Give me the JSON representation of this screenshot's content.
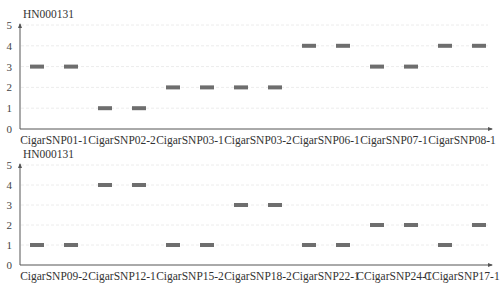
{
  "chart_data": [
    {
      "type": "scatter",
      "marker": "horizontal-bar",
      "title": "HN000131",
      "xlabel": "",
      "ylabel": "",
      "ylim": [
        0,
        5
      ],
      "yticks": [
        0,
        1,
        2,
        3,
        4,
        5
      ],
      "grid": true,
      "categories": [
        "CigarSNP01-1",
        "CigarSNP02-2",
        "CigarSNP03-1",
        "CigarSNP03-2",
        "CigarSNP06-1",
        "CigarSNP07-1",
        "CigarSNP08-1"
      ],
      "values": [
        3,
        3,
        1,
        1,
        2,
        2,
        2,
        2,
        4,
        4,
        3,
        3,
        4,
        4
      ],
      "pairs": [
        [
          3,
          3
        ],
        [
          1,
          1
        ],
        [
          2,
          2
        ],
        [
          2,
          2
        ],
        [
          4,
          4
        ],
        [
          3,
          3
        ],
        [
          4,
          4
        ]
      ]
    },
    {
      "type": "scatter",
      "marker": "horizontal-bar",
      "title": "HN000131",
      "xlabel": "",
      "ylabel": "",
      "ylim": [
        0,
        5
      ],
      "yticks": [
        0,
        1,
        2,
        3,
        4,
        5
      ],
      "grid": true,
      "categories": [
        "CigarSNP09-2",
        "CigarSNP12-1",
        "CigarSNP15-2",
        "CigarSNP18-2",
        "CigarSNP22-1",
        "CCigarSNP24-1",
        "CCigarSNP17-1"
      ],
      "values": [
        1,
        1,
        4,
        4,
        1,
        1,
        3,
        3,
        1,
        1,
        2,
        2,
        1,
        2
      ],
      "pairs": [
        [
          1,
          1
        ],
        [
          4,
          4
        ],
        [
          1,
          1
        ],
        [
          3,
          3
        ],
        [
          1,
          1
        ],
        [
          2,
          2
        ],
        [
          1,
          2
        ]
      ]
    }
  ],
  "colors": {
    "bar": "#6e6e6e",
    "axis": "#555555",
    "grid": "#ececec"
  }
}
